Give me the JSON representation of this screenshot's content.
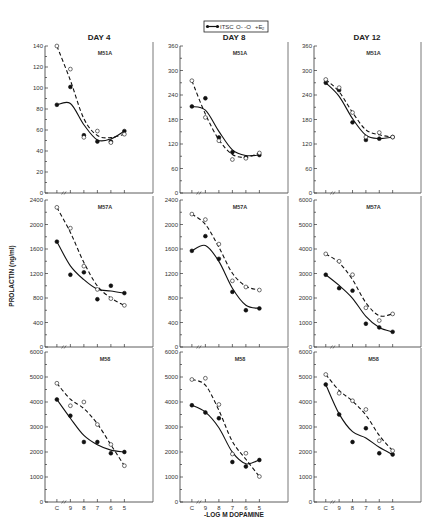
{
  "legend": {
    "solid_label": "ITSC",
    "dashed_label": "+E",
    "dashed_subscript": "2",
    "dashed_prefix": "O- -O"
  },
  "columns": [
    {
      "title": "DAY 4"
    },
    {
      "title": "DAY 8"
    },
    {
      "title": "DAY 12"
    }
  ],
  "ylabel": "PROLACTIN (ng/ml)",
  "xlabel": "-LOG M DOPAMINE",
  "x_ticks": [
    "C",
    "9",
    "8",
    "7",
    "6",
    "5"
  ],
  "chart_data": [
    {
      "type": "line",
      "title": "DAY 4 — M51A",
      "panel": "M51A",
      "day": "DAY 4",
      "ylim": [
        0,
        140
      ],
      "yticks": [
        0,
        20,
        40,
        60,
        80,
        100,
        120,
        140
      ],
      "categories": [
        "C",
        "9",
        "8",
        "7",
        "6",
        "5"
      ],
      "series": [
        {
          "name": "ITSC",
          "style": "solid",
          "marker": "filled",
          "values": [
            84,
            101,
            55,
            49,
            49,
            59
          ]
        },
        {
          "name": "+E2",
          "style": "dashed",
          "marker": "open",
          "values": [
            140,
            118,
            53,
            59,
            48,
            56
          ]
        }
      ]
    },
    {
      "type": "line",
      "title": "DAY 8 — M51A",
      "panel": "M51A",
      "day": "DAY 8",
      "ylim": [
        0,
        360
      ],
      "yticks": [
        0,
        60,
        120,
        180,
        240,
        300,
        360
      ],
      "categories": [
        "C",
        "9",
        "8",
        "7",
        "6",
        "5"
      ],
      "series": [
        {
          "name": "ITSC",
          "style": "solid",
          "marker": "filled",
          "values": [
            212,
            232,
            136,
            100,
            87,
            93
          ]
        },
        {
          "name": "+E2",
          "style": "dashed",
          "marker": "open",
          "values": [
            275,
            185,
            128,
            82,
            85,
            98
          ]
        }
      ]
    },
    {
      "type": "line",
      "title": "DAY 12 — M51A",
      "panel": "M51A",
      "day": "DAY 12",
      "ylim": [
        0,
        360
      ],
      "yticks": [
        0,
        60,
        120,
        180,
        240,
        300,
        360
      ],
      "categories": [
        "C",
        "9",
        "8",
        "7",
        "6",
        "5"
      ],
      "series": [
        {
          "name": "ITSC",
          "style": "solid",
          "marker": "filled",
          "values": [
            270,
            252,
            173,
            130,
            133,
            137
          ]
        },
        {
          "name": "+E2",
          "style": "dashed",
          "marker": "open",
          "values": [
            278,
            258,
            197,
            137,
            148,
            137
          ]
        }
      ]
    },
    {
      "type": "line",
      "title": "DAY 4 — M57A",
      "panel": "M57A",
      "day": "DAY 4",
      "ylim": [
        0,
        2400
      ],
      "yticks": [
        0,
        400,
        800,
        1200,
        1600,
        2000,
        2400
      ],
      "categories": [
        "C",
        "9",
        "8",
        "7",
        "6",
        "5"
      ],
      "series": [
        {
          "name": "ITSC",
          "style": "solid",
          "marker": "filled",
          "values": [
            1720,
            1180,
            1220,
            780,
            1000,
            880
          ]
        },
        {
          "name": "+E2",
          "style": "dashed",
          "marker": "open",
          "values": [
            2280,
            1940,
            1320,
            940,
            790,
            680
          ]
        }
      ]
    },
    {
      "type": "line",
      "title": "DAY 8 — M57A",
      "panel": "M57A",
      "day": "DAY 8",
      "ylim": [
        0,
        2400
      ],
      "yticks": [
        0,
        400,
        800,
        1200,
        1600,
        2000,
        2400
      ],
      "categories": [
        "C",
        "9",
        "8",
        "7",
        "6",
        "5"
      ],
      "series": [
        {
          "name": "ITSC",
          "style": "solid",
          "marker": "filled",
          "values": [
            1570,
            1810,
            1440,
            900,
            600,
            630
          ]
        },
        {
          "name": "+E2",
          "style": "dashed",
          "marker": "open",
          "values": [
            2170,
            2080,
            1680,
            1080,
            980,
            930
          ]
        }
      ]
    },
    {
      "type": "line",
      "title": "DAY 12 — M57A",
      "panel": "M57A",
      "day": "DAY 12",
      "ylim": [
        0,
        6000
      ],
      "yticks": [
        0,
        1000,
        2000,
        3000,
        4000,
        5000,
        6000
      ],
      "categories": [
        "C",
        "9",
        "8",
        "7",
        "6",
        "5"
      ],
      "series": [
        {
          "name": "ITSC",
          "style": "solid",
          "marker": "filled",
          "values": [
            2950,
            2400,
            2300,
            950,
            800,
            620
          ]
        },
        {
          "name": "+E2",
          "style": "dashed",
          "marker": "open",
          "values": [
            3800,
            3500,
            2950,
            1600,
            1080,
            1350
          ]
        }
      ]
    },
    {
      "type": "line",
      "title": "DAY 4 — M58",
      "panel": "M58",
      "day": "DAY 4",
      "ylim": [
        0,
        6000
      ],
      "yticks": [
        0,
        1000,
        2000,
        3000,
        4000,
        5000,
        6000
      ],
      "categories": [
        "C",
        "9",
        "8",
        "7",
        "6",
        "5"
      ],
      "series": [
        {
          "name": "ITSC",
          "style": "solid",
          "marker": "filled",
          "values": [
            4100,
            3450,
            2400,
            2400,
            1950,
            2000
          ]
        },
        {
          "name": "+E2",
          "style": "dashed",
          "marker": "open",
          "values": [
            4750,
            3850,
            4000,
            3100,
            2300,
            1450
          ]
        }
      ]
    },
    {
      "type": "line",
      "title": "DAY 8 — M58",
      "panel": "M58",
      "day": "DAY 8",
      "ylim": [
        0,
        6000
      ],
      "yticks": [
        0,
        1000,
        2000,
        3000,
        4000,
        5000,
        6000
      ],
      "categories": [
        "C",
        "9",
        "8",
        "7",
        "6",
        "5"
      ],
      "series": [
        {
          "name": "ITSC",
          "style": "solid",
          "marker": "filled",
          "values": [
            3870,
            3580,
            3350,
            1600,
            1420,
            1680
          ]
        },
        {
          "name": "+E2",
          "style": "dashed",
          "marker": "open",
          "values": [
            4900,
            4950,
            3900,
            1920,
            1950,
            1020
          ]
        }
      ]
    },
    {
      "type": "line",
      "title": "DAY 12 — M58",
      "panel": "M58",
      "day": "DAY 12",
      "ylim": [
        0,
        6000
      ],
      "yticks": [
        0,
        1000,
        2000,
        3000,
        4000,
        5000,
        6000
      ],
      "categories": [
        "C",
        "9",
        "8",
        "7",
        "6",
        "5"
      ],
      "series": [
        {
          "name": "ITSC",
          "style": "solid",
          "marker": "filled",
          "values": [
            4700,
            3500,
            2400,
            2950,
            1950,
            1900
          ]
        },
        {
          "name": "+E2",
          "style": "dashed",
          "marker": "open",
          "values": [
            5100,
            4350,
            4050,
            3700,
            2450,
            2050
          ]
        }
      ]
    }
  ]
}
